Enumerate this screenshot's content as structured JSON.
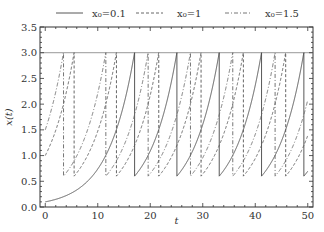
{
  "chart_data": {
    "type": "line",
    "title": "",
    "xlabel": "t",
    "ylabel": "x(t)",
    "xlim": [
      -1,
      51
    ],
    "ylim": [
      0.0,
      3.5
    ],
    "xticks": [
      0,
      10,
      20,
      30,
      40,
      50
    ],
    "xtick_labels": [
      "0",
      "10",
      "20",
      "30",
      "40",
      "50"
    ],
    "yticks": [
      0.0,
      0.5,
      1.0,
      1.5,
      2.0,
      2.5,
      3.0,
      3.5
    ],
    "ytick_labels": [
      "0.0",
      "0.5",
      "1.0",
      "1.5",
      "2.0",
      "2.5",
      "3.0",
      "3.5"
    ],
    "grid": false,
    "legend_position": "top-outside",
    "threshold_line": {
      "y": 3.0,
      "color": "#999999"
    },
    "model": {
      "growth_rate": 0.2,
      "threshold": 3.0,
      "reset_value": 0.6,
      "t_end": 50
    },
    "series": [
      {
        "name": "x0=0.1",
        "legend_label": "x₀=0.1",
        "x0": 0.1,
        "style": "solid",
        "color": "#444444",
        "reset_times": [
          17.0,
          25.1,
          33.1,
          41.2,
          49.2
        ]
      },
      {
        "name": "x0=1",
        "legend_label": "x₀=1",
        "x0": 1.0,
        "style": "dashed",
        "color": "#555555",
        "reset_times": [
          5.5,
          13.5,
          21.6,
          29.6,
          37.7,
          45.7
        ]
      },
      {
        "name": "x0=1.5",
        "legend_label": "x₀=1.5",
        "x0": 1.5,
        "style": "dashdot",
        "color": "#666666",
        "reset_times": [
          3.5,
          11.5,
          19.6,
          27.6,
          35.7,
          43.7
        ]
      }
    ]
  }
}
